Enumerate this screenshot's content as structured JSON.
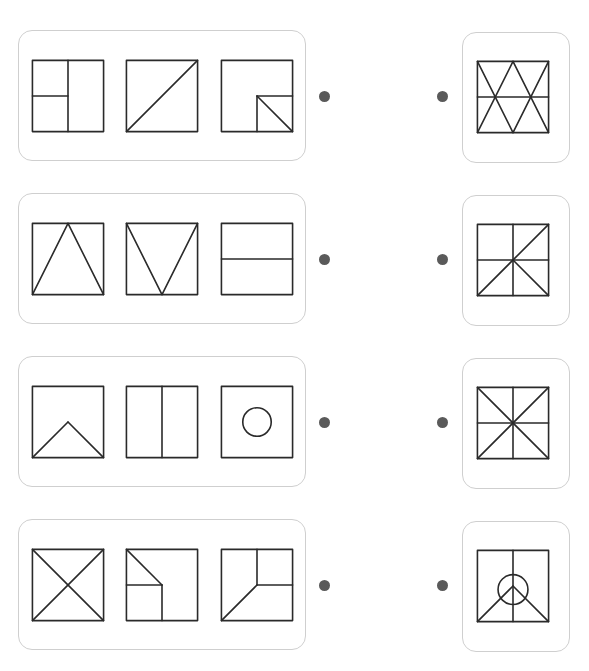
{
  "task": "match-figures",
  "colors": {
    "stroke": "#2a2a2a",
    "card_border": "#cfcfcf",
    "dot": "#5a5a5a"
  },
  "rows": [
    {
      "left_figures": [
        {
          "name": "square-split-vertical-with-left-half-split",
          "lines": [
            [
              50,
              0,
              50,
              100
            ],
            [
              0,
              50,
              50,
              50
            ]
          ],
          "circles": []
        },
        {
          "name": "square-diagonal-bl-tr",
          "lines": [
            [
              0,
              100,
              100,
              0
            ]
          ],
          "circles": []
        },
        {
          "name": "square-with-bottom-right-quadrant-diagonal",
          "lines": [
            [
              50,
              50,
              100,
              50
            ],
            [
              50,
              50,
              50,
              100
            ],
            [
              50,
              50,
              100,
              100
            ]
          ],
          "circles": []
        }
      ],
      "right_figure": {
        "name": "square-zigzag-triangles-midline",
        "lines": [
          [
            0,
            50,
            100,
            50
          ],
          [
            0,
            0,
            50,
            100
          ],
          [
            50,
            0,
            0,
            100
          ],
          [
            50,
            0,
            100,
            100
          ],
          [
            100,
            0,
            50,
            100
          ]
        ],
        "circles": []
      }
    },
    {
      "left_figures": [
        {
          "name": "square-upright-triangle",
          "lines": [
            [
              0,
              100,
              50,
              0
            ],
            [
              50,
              0,
              100,
              100
            ]
          ],
          "circles": []
        },
        {
          "name": "square-inverted-triangle",
          "lines": [
            [
              0,
              0,
              50,
              100
            ],
            [
              50,
              100,
              100,
              0
            ]
          ],
          "circles": []
        },
        {
          "name": "square-horizontal-midline",
          "lines": [
            [
              0,
              50,
              100,
              50
            ]
          ],
          "circles": []
        }
      ],
      "right_figure": {
        "name": "square-cross-diagonal-and-half-diagonal",
        "lines": [
          [
            50,
            0,
            50,
            100
          ],
          [
            0,
            50,
            100,
            50
          ],
          [
            0,
            100,
            100,
            0
          ],
          [
            50,
            50,
            100,
            100
          ]
        ],
        "circles": []
      }
    },
    {
      "left_figures": [
        {
          "name": "square-bottom-roof",
          "lines": [
            [
              0,
              100,
              50,
              50
            ],
            [
              50,
              50,
              100,
              100
            ]
          ],
          "circles": []
        },
        {
          "name": "square-vertical-midline",
          "lines": [
            [
              50,
              0,
              50,
              100
            ]
          ],
          "circles": []
        },
        {
          "name": "square-center-circle",
          "lines": [],
          "circles": [
            [
              50,
              50,
              20
            ]
          ]
        }
      ],
      "right_figure": {
        "name": "square-eight-way-star",
        "lines": [
          [
            50,
            0,
            50,
            100
          ],
          [
            0,
            50,
            100,
            50
          ],
          [
            0,
            0,
            100,
            100
          ],
          [
            0,
            100,
            100,
            0
          ]
        ],
        "circles": []
      }
    },
    {
      "left_figures": [
        {
          "name": "square-x-diagonals",
          "lines": [
            [
              0,
              0,
              100,
              100
            ],
            [
              0,
              100,
              100,
              0
            ]
          ],
          "circles": []
        },
        {
          "name": "square-bottom-left-quadrant-with-diagonal",
          "lines": [
            [
              0,
              50,
              50,
              50
            ],
            [
              50,
              50,
              50,
              100
            ],
            [
              0,
              0,
              50,
              50
            ]
          ],
          "circles": []
        },
        {
          "name": "square-top-right-quadrant-with-diagonal",
          "lines": [
            [
              50,
              0,
              50,
              50
            ],
            [
              50,
              50,
              100,
              50
            ],
            [
              0,
              100,
              50,
              50
            ]
          ],
          "circles": []
        }
      ],
      "right_figure": {
        "name": "square-peace-circle-roof",
        "lines": [
          [
            50,
            0,
            50,
            100
          ],
          [
            0,
            100,
            50,
            50
          ],
          [
            50,
            50,
            100,
            100
          ]
        ],
        "circles": [
          [
            50,
            55,
            21
          ]
        ]
      }
    }
  ]
}
